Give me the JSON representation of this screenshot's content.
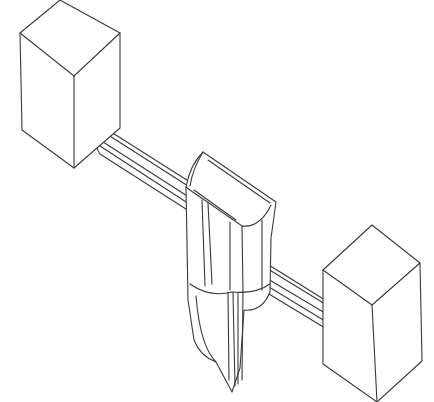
{
  "diagram": {
    "type": "isometric-line-drawing",
    "components": [
      {
        "id": "left-block",
        "label": "Left rectangular block"
      },
      {
        "id": "left-rod",
        "label": "Left rod segment"
      },
      {
        "id": "center-part",
        "label": "Central vertical component"
      },
      {
        "id": "right-rod",
        "label": "Right rod segment"
      },
      {
        "id": "right-block",
        "label": "Right rectangular block"
      }
    ],
    "colors": {
      "stroke": "#3a3a3a",
      "background": "#ffffff"
    }
  }
}
